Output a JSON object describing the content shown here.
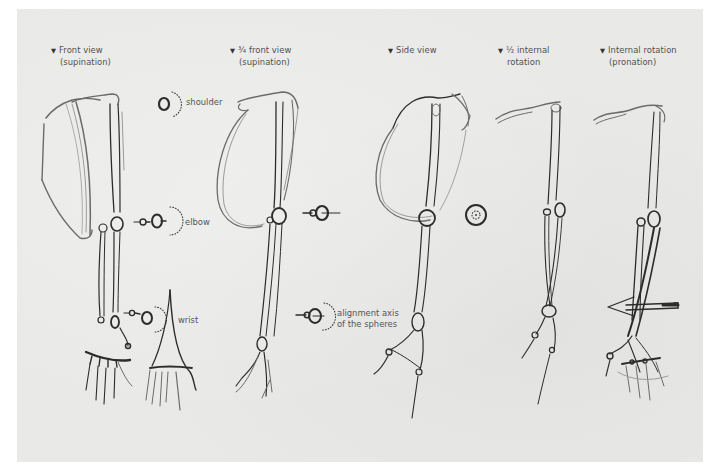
{
  "figure": {
    "background_color": "#ffffff",
    "paper_color": "#e9e9e7",
    "ink_color": "#2c2c2c",
    "label_color": "#555555"
  },
  "views": [
    {
      "marker": "▼",
      "line1": "Front view",
      "line2": "(supination)"
    },
    {
      "marker": "▼",
      "line1": "¾ front view",
      "line2": "(supination)"
    },
    {
      "marker": "▼",
      "line1": "Side view",
      "line2": ""
    },
    {
      "marker": "▼",
      "line1": "½ internal",
      "line2": "rotation"
    },
    {
      "marker": "▼",
      "line1": "Internal rotation",
      "line2": "(pronation)"
    }
  ],
  "joint_labels": {
    "shoulder": "shoulder",
    "elbow": "elbow",
    "wrist": "wrist",
    "alignment_line1": "alignment axis",
    "alignment_line2": "of the spheres"
  }
}
